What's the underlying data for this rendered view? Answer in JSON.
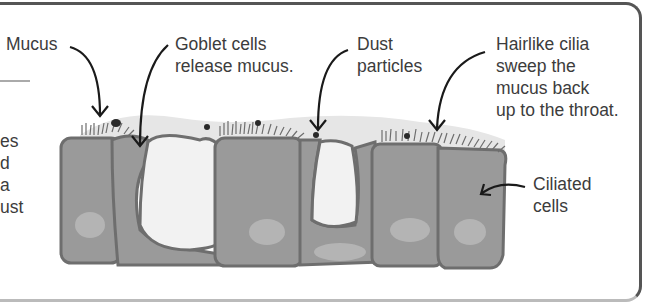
{
  "diagram": {
    "labels": {
      "mucus": "Mucus",
      "goblet": "Goblet cells\nrelease mucus.",
      "dust": "Dust\nparticles",
      "cilia": "Hairlike cilia\nsweep the\nmucus back\nup to the throat.",
      "ciliated_cells": "Ciliated\ncells"
    },
    "clipped_side_text": "es\nd\na\nust",
    "colors": {
      "cell_fill": "#9a9a9a",
      "cell_outline": "#6e6e6e",
      "nucleus": "#b4b4b4",
      "mucus_layer": "#e6e6e6",
      "goblet_interior": "#f2f2f2",
      "arrow": "#1a1a1a",
      "text": "#3c3c3c",
      "frame": "#555555"
    }
  }
}
